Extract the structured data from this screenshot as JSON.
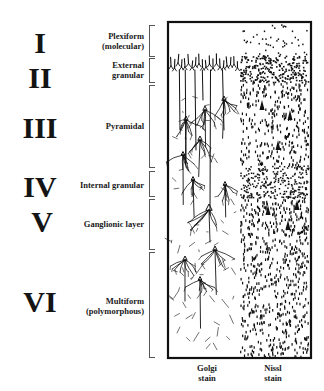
{
  "figure": {
    "layers": [
      {
        "numeral": "I",
        "name": "Plexiform\n(molecular)",
        "top": 25,
        "bottom": 55
      },
      {
        "numeral": "II",
        "name": "External\ngranular",
        "top": 58,
        "bottom": 81
      },
      {
        "numeral": "III",
        "name": "Pyramidal",
        "top": 85,
        "bottom": 166
      },
      {
        "numeral": "IV",
        "name": "Internal granular",
        "top": 171,
        "bottom": 195
      },
      {
        "numeral": "V",
        "name": "Ganglionic layer",
        "top": 199,
        "bottom": 248
      },
      {
        "numeral": "VI",
        "name": "Multiform\n(polymorphous)",
        "top": 252,
        "bottom": 356
      }
    ],
    "stains": [
      {
        "label": "Golgi\nstain"
      },
      {
        "label": "Nissl\nstain"
      }
    ],
    "colors": {
      "ink": "#111111",
      "bracket": "#555555",
      "background": "#ffffff"
    }
  }
}
